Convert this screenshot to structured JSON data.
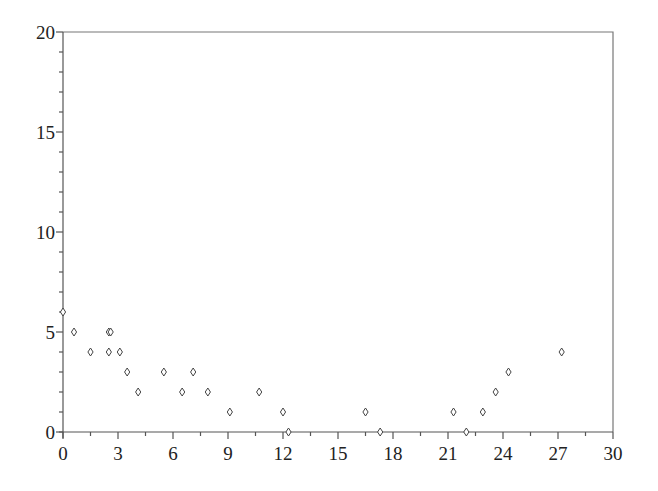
{
  "chart_data": {
    "type": "scatter",
    "title": "",
    "xlabel": "",
    "ylabel": "",
    "xlim": [
      0,
      30
    ],
    "ylim": [
      0,
      20
    ],
    "grid": false,
    "legend": null,
    "marker": "diamond",
    "xticks": [
      0,
      3,
      6,
      9,
      12,
      15,
      18,
      21,
      24,
      27,
      30
    ],
    "xtick_labels": [
      "0",
      "3",
      "6",
      "9",
      "12",
      "15",
      "18",
      "21",
      "24",
      "27",
      "30"
    ],
    "x_minor_step": 1.5,
    "yticks": [
      0,
      5,
      10,
      15,
      20
    ],
    "ytick_labels": [
      "0",
      "5",
      "10",
      "15",
      "20"
    ],
    "y_minor_step": 1,
    "series": [
      {
        "name": "data",
        "points": [
          {
            "x": 0.0,
            "y": 6
          },
          {
            "x": 0.6,
            "y": 5
          },
          {
            "x": 1.5,
            "y": 4
          },
          {
            "x": 2.5,
            "y": 5
          },
          {
            "x": 2.6,
            "y": 5
          },
          {
            "x": 2.5,
            "y": 4
          },
          {
            "x": 3.1,
            "y": 4
          },
          {
            "x": 3.5,
            "y": 3
          },
          {
            "x": 4.1,
            "y": 2
          },
          {
            "x": 5.5,
            "y": 3
          },
          {
            "x": 6.5,
            "y": 2
          },
          {
            "x": 7.1,
            "y": 3
          },
          {
            "x": 7.9,
            "y": 2
          },
          {
            "x": 9.1,
            "y": 1
          },
          {
            "x": 10.7,
            "y": 2
          },
          {
            "x": 12.0,
            "y": 1
          },
          {
            "x": 12.3,
            "y": 0
          },
          {
            "x": 16.5,
            "y": 1
          },
          {
            "x": 17.3,
            "y": 0
          },
          {
            "x": 21.3,
            "y": 1
          },
          {
            "x": 22.0,
            "y": 0
          },
          {
            "x": 22.9,
            "y": 1
          },
          {
            "x": 23.6,
            "y": 2
          },
          {
            "x": 24.3,
            "y": 3
          },
          {
            "x": 27.2,
            "y": 4
          }
        ]
      }
    ]
  },
  "layout": {
    "plot_left": 63,
    "plot_right": 613,
    "plot_top": 32,
    "plot_bottom": 432
  }
}
